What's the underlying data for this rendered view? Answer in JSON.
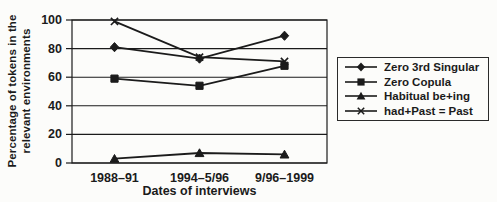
{
  "figure": {
    "background_color": "#fcfcfa",
    "ink_color": "#1b1b1b"
  },
  "chart_data": {
    "type": "line",
    "title": "",
    "xlabel": "Dates of interviews",
    "ylabel": "Percentage of tokens in the relevant environments",
    "ylabel_lines": [
      "Percentage of tokens in the",
      "relevant environments"
    ],
    "categories": [
      "1988–91",
      "1994–5/96",
      "9/96–1999"
    ],
    "yticks": [
      0,
      20,
      40,
      60,
      80,
      100
    ],
    "ylim": [
      0,
      100
    ],
    "grid": "horizontal",
    "legend_position": "right",
    "series": [
      {
        "name": "Zero 3rd Singular",
        "marker": "diamond",
        "values": [
          81,
          73,
          89
        ]
      },
      {
        "name": "Zero Copula",
        "marker": "square",
        "values": [
          59,
          54,
          68
        ]
      },
      {
        "name": "Habitual be+ing",
        "marker": "triangle",
        "values": [
          3,
          7,
          6
        ]
      },
      {
        "name": "had+Past = Past",
        "marker": "x",
        "values": [
          99,
          74,
          71
        ]
      }
    ]
  }
}
